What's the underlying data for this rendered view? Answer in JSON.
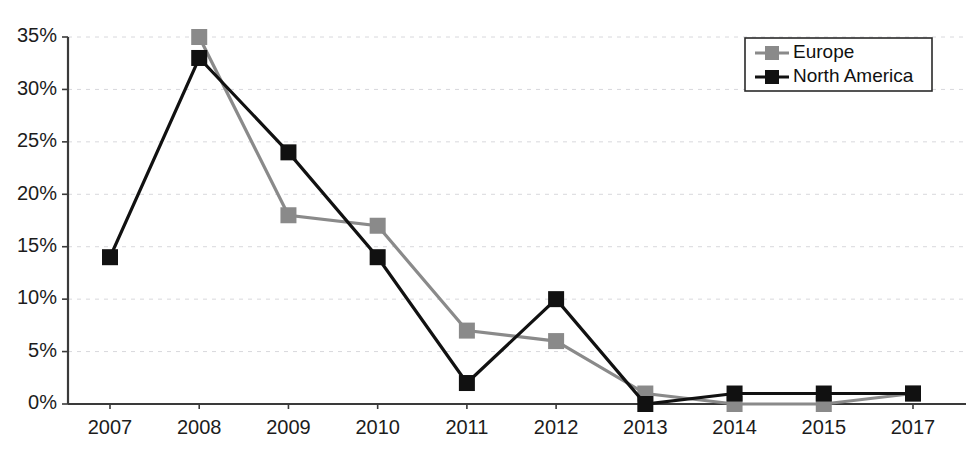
{
  "chart_data": {
    "type": "line",
    "title": "",
    "xlabel": "",
    "ylabel": "",
    "categories": [
      "2007",
      "2008",
      "2009",
      "2010",
      "2011",
      "2012",
      "2013",
      "2014",
      "2015",
      "2017"
    ],
    "ylim": [
      0,
      35
    ],
    "y_ticks": [
      "0%",
      "5%",
      "10%",
      "15%",
      "20%",
      "25%",
      "30%",
      "35%"
    ],
    "y_tick_values": [
      0,
      5,
      10,
      15,
      20,
      25,
      30,
      35
    ],
    "grid": true,
    "legend_position": "top-right",
    "value_suffix": "%",
    "series": [
      {
        "name": "Europe",
        "color": "#8a8a8a",
        "marker": "square",
        "values": [
          null,
          35,
          18,
          17,
          7,
          6,
          1,
          0,
          0,
          1
        ]
      },
      {
        "name": "North America",
        "color": "#111111",
        "marker": "square",
        "values": [
          14,
          33,
          24,
          14,
          2,
          10,
          0,
          1,
          1,
          1
        ]
      }
    ]
  },
  "legend": {
    "entries": [
      {
        "label": "Europe"
      },
      {
        "label": "North America"
      }
    ]
  },
  "axes": {
    "y_labels": [
      "35%",
      "30%",
      "25%",
      "20%",
      "15%",
      "10%",
      "5%",
      "0%"
    ],
    "x_labels": [
      "2007",
      "2008",
      "2009",
      "2010",
      "2011",
      "2012",
      "2013",
      "2014",
      "2015",
      "2017"
    ]
  }
}
